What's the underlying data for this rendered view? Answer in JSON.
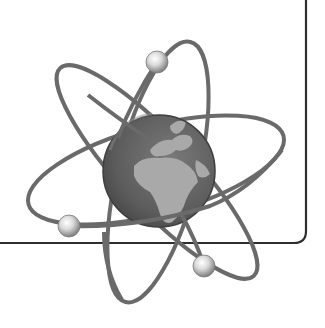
{
  "illustration": {
    "subject": "atom-globe",
    "description": "Grayscale atom symbol with Earth globe as nucleus and three orbiting electrons",
    "colors": {
      "background": "#ffffff",
      "frame": "#2e2e2e",
      "orbit": "#6a6a6a",
      "globe_ocean": "#5e5e5e",
      "globe_land": "#a8a8a8",
      "electron_light": "#f2f2f2",
      "electron_dark": "#8c8c8c"
    },
    "electron_count": 3
  }
}
